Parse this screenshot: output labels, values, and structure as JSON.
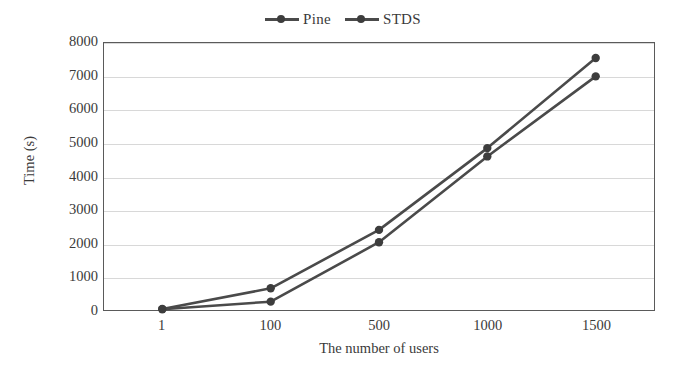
{
  "chart_data": {
    "type": "line",
    "title": "",
    "xlabel": "The number of users",
    "ylabel": "Time (s)",
    "categories": [
      "1",
      "100",
      "500",
      "1000",
      "1500"
    ],
    "series": [
      {
        "name": "Pine",
        "values": [
          30,
          650,
          2400,
          4850,
          7550
        ]
      },
      {
        "name": "STDS",
        "values": [
          25,
          250,
          2030,
          4600,
          7000
        ]
      }
    ],
    "ylim": [
      0,
      8000
    ],
    "yticks": [
      "0",
      "1000",
      "2000",
      "3000",
      "4000",
      "5000",
      "6000",
      "7000",
      "8000"
    ],
    "ytick_values": [
      0,
      1000,
      2000,
      3000,
      4000,
      5000,
      6000,
      7000,
      8000
    ],
    "grid": true,
    "legend_position": "top-center",
    "marker": "circle",
    "line_color": "#4a4a4a",
    "marker_color": "#3d3d3d",
    "grid_color": "#d8d8d8",
    "axis_color": "#5a5a5a"
  },
  "legend": {
    "entries": [
      {
        "label": "Pine"
      },
      {
        "label": "STDS"
      }
    ]
  }
}
